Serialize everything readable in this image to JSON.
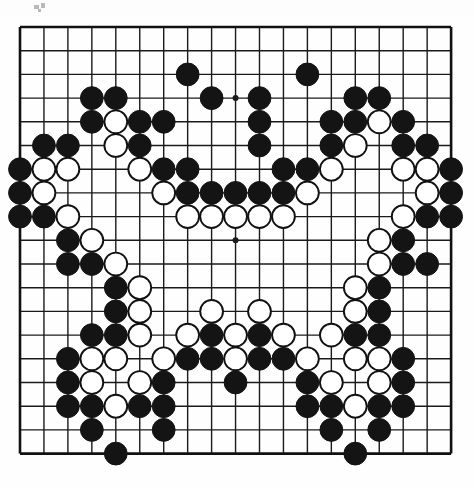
{
  "app": {
    "title": "Go board diagram",
    "type": "go-game-position",
    "board_size": 19
  },
  "board": {
    "background_color": "#fefefe",
    "line_color": "#1a1a1a",
    "border_color": "#111111",
    "black_stone_color": "#141414",
    "white_stone_color": "#ffffff",
    "white_stone_edge_color": "#111111",
    "origin_x": 20,
    "origin_y": 27,
    "spacing_x": 23.95,
    "spacing_y": 23.7,
    "line_width": 1.4,
    "border_width": 2.6,
    "stone_radius": 11.4,
    "star_point_radius": 3.0,
    "star_points": [
      {
        "col": 10,
        "row": 4
      },
      {
        "col": 10,
        "row": 10
      }
    ]
  },
  "chart_data": {
    "type": "table",
    "xlabel": "column 1-19 (left to right)",
    "ylabel": "row 1-19 (top to bottom)",
    "legend": [
      "B = black stone",
      "W = white stone"
    ],
    "black_count": 106,
    "white_count": 58,
    "stones": [
      {
        "col": 8,
        "row": 3,
        "color": "B"
      },
      {
        "col": 13,
        "row": 3,
        "color": "B"
      },
      {
        "col": 4,
        "row": 4,
        "color": "B"
      },
      {
        "col": 5,
        "row": 4,
        "color": "B"
      },
      {
        "col": 9,
        "row": 4,
        "color": "B"
      },
      {
        "col": 11,
        "row": 4,
        "color": "B"
      },
      {
        "col": 15,
        "row": 4,
        "color": "B"
      },
      {
        "col": 16,
        "row": 4,
        "color": "B"
      },
      {
        "col": 4,
        "row": 5,
        "color": "B"
      },
      {
        "col": 5,
        "row": 5,
        "color": "W"
      },
      {
        "col": 6,
        "row": 5,
        "color": "B"
      },
      {
        "col": 7,
        "row": 5,
        "color": "B"
      },
      {
        "col": 11,
        "row": 5,
        "color": "B"
      },
      {
        "col": 14,
        "row": 5,
        "color": "B"
      },
      {
        "col": 15,
        "row": 5,
        "color": "B"
      },
      {
        "col": 16,
        "row": 5,
        "color": "W"
      },
      {
        "col": 17,
        "row": 5,
        "color": "B"
      },
      {
        "col": 2,
        "row": 6,
        "color": "B"
      },
      {
        "col": 3,
        "row": 6,
        "color": "B"
      },
      {
        "col": 5,
        "row": 6,
        "color": "W"
      },
      {
        "col": 6,
        "row": 6,
        "color": "B"
      },
      {
        "col": 11,
        "row": 6,
        "color": "B"
      },
      {
        "col": 14,
        "row": 6,
        "color": "B"
      },
      {
        "col": 15,
        "row": 6,
        "color": "W"
      },
      {
        "col": 17,
        "row": 6,
        "color": "B"
      },
      {
        "col": 18,
        "row": 6,
        "color": "B"
      },
      {
        "col": 1,
        "row": 7,
        "color": "B"
      },
      {
        "col": 2,
        "row": 7,
        "color": "W"
      },
      {
        "col": 3,
        "row": 7,
        "color": "W"
      },
      {
        "col": 6,
        "row": 7,
        "color": "W"
      },
      {
        "col": 7,
        "row": 7,
        "color": "B"
      },
      {
        "col": 8,
        "row": 7,
        "color": "B"
      },
      {
        "col": 12,
        "row": 7,
        "color": "B"
      },
      {
        "col": 13,
        "row": 7,
        "color": "B"
      },
      {
        "col": 14,
        "row": 7,
        "color": "W"
      },
      {
        "col": 17,
        "row": 7,
        "color": "W"
      },
      {
        "col": 18,
        "row": 7,
        "color": "W"
      },
      {
        "col": 19,
        "row": 7,
        "color": "B"
      },
      {
        "col": 1,
        "row": 8,
        "color": "B"
      },
      {
        "col": 2,
        "row": 8,
        "color": "W"
      },
      {
        "col": 7,
        "row": 8,
        "color": "W"
      },
      {
        "col": 8,
        "row": 8,
        "color": "B"
      },
      {
        "col": 9,
        "row": 8,
        "color": "B"
      },
      {
        "col": 10,
        "row": 8,
        "color": "B"
      },
      {
        "col": 11,
        "row": 8,
        "color": "B"
      },
      {
        "col": 12,
        "row": 8,
        "color": "B"
      },
      {
        "col": 13,
        "row": 8,
        "color": "W"
      },
      {
        "col": 18,
        "row": 8,
        "color": "W"
      },
      {
        "col": 19,
        "row": 8,
        "color": "B"
      },
      {
        "col": 1,
        "row": 9,
        "color": "B"
      },
      {
        "col": 2,
        "row": 9,
        "color": "B"
      },
      {
        "col": 3,
        "row": 9,
        "color": "W"
      },
      {
        "col": 8,
        "row": 9,
        "color": "W"
      },
      {
        "col": 9,
        "row": 9,
        "color": "W"
      },
      {
        "col": 10,
        "row": 9,
        "color": "W"
      },
      {
        "col": 11,
        "row": 9,
        "color": "W"
      },
      {
        "col": 12,
        "row": 9,
        "color": "W"
      },
      {
        "col": 17,
        "row": 9,
        "color": "W"
      },
      {
        "col": 18,
        "row": 9,
        "color": "B"
      },
      {
        "col": 19,
        "row": 9,
        "color": "B"
      },
      {
        "col": 3,
        "row": 10,
        "color": "B"
      },
      {
        "col": 4,
        "row": 10,
        "color": "W"
      },
      {
        "col": 16,
        "row": 10,
        "color": "W"
      },
      {
        "col": 17,
        "row": 10,
        "color": "B"
      },
      {
        "col": 3,
        "row": 11,
        "color": "B"
      },
      {
        "col": 4,
        "row": 11,
        "color": "B"
      },
      {
        "col": 5,
        "row": 11,
        "color": "W"
      },
      {
        "col": 16,
        "row": 11,
        "color": "W"
      },
      {
        "col": 17,
        "row": 11,
        "color": "B"
      },
      {
        "col": 18,
        "row": 11,
        "color": "B"
      },
      {
        "col": 5,
        "row": 12,
        "color": "B"
      },
      {
        "col": 6,
        "row": 12,
        "color": "W"
      },
      {
        "col": 15,
        "row": 12,
        "color": "W"
      },
      {
        "col": 16,
        "row": 12,
        "color": "B"
      },
      {
        "col": 5,
        "row": 13,
        "color": "B"
      },
      {
        "col": 6,
        "row": 13,
        "color": "W"
      },
      {
        "col": 9,
        "row": 13,
        "color": "W"
      },
      {
        "col": 11,
        "row": 13,
        "color": "W"
      },
      {
        "col": 15,
        "row": 13,
        "color": "W"
      },
      {
        "col": 16,
        "row": 13,
        "color": "B"
      },
      {
        "col": 4,
        "row": 14,
        "color": "B"
      },
      {
        "col": 5,
        "row": 14,
        "color": "B"
      },
      {
        "col": 6,
        "row": 14,
        "color": "W"
      },
      {
        "col": 8,
        "row": 14,
        "color": "W"
      },
      {
        "col": 9,
        "row": 14,
        "color": "B"
      },
      {
        "col": 10,
        "row": 14,
        "color": "W"
      },
      {
        "col": 11,
        "row": 14,
        "color": "B"
      },
      {
        "col": 12,
        "row": 14,
        "color": "W"
      },
      {
        "col": 14,
        "row": 14,
        "color": "W"
      },
      {
        "col": 15,
        "row": 14,
        "color": "B"
      },
      {
        "col": 16,
        "row": 14,
        "color": "B"
      },
      {
        "col": 3,
        "row": 15,
        "color": "B"
      },
      {
        "col": 4,
        "row": 15,
        "color": "W"
      },
      {
        "col": 5,
        "row": 15,
        "color": "W"
      },
      {
        "col": 7,
        "row": 15,
        "color": "W"
      },
      {
        "col": 8,
        "row": 15,
        "color": "B"
      },
      {
        "col": 9,
        "row": 15,
        "color": "B"
      },
      {
        "col": 10,
        "row": 15,
        "color": "W"
      },
      {
        "col": 11,
        "row": 15,
        "color": "B"
      },
      {
        "col": 12,
        "row": 15,
        "color": "B"
      },
      {
        "col": 13,
        "row": 15,
        "color": "W"
      },
      {
        "col": 15,
        "row": 15,
        "color": "W"
      },
      {
        "col": 16,
        "row": 15,
        "color": "W"
      },
      {
        "col": 17,
        "row": 15,
        "color": "B"
      },
      {
        "col": 3,
        "row": 16,
        "color": "B"
      },
      {
        "col": 4,
        "row": 16,
        "color": "W"
      },
      {
        "col": 6,
        "row": 16,
        "color": "W"
      },
      {
        "col": 7,
        "row": 16,
        "color": "B"
      },
      {
        "col": 10,
        "row": 16,
        "color": "B"
      },
      {
        "col": 13,
        "row": 16,
        "color": "B"
      },
      {
        "col": 14,
        "row": 16,
        "color": "W"
      },
      {
        "col": 16,
        "row": 16,
        "color": "W"
      },
      {
        "col": 17,
        "row": 16,
        "color": "B"
      },
      {
        "col": 3,
        "row": 17,
        "color": "B"
      },
      {
        "col": 4,
        "row": 17,
        "color": "B"
      },
      {
        "col": 5,
        "row": 17,
        "color": "W"
      },
      {
        "col": 6,
        "row": 17,
        "color": "B"
      },
      {
        "col": 7,
        "row": 17,
        "color": "B"
      },
      {
        "col": 13,
        "row": 17,
        "color": "B"
      },
      {
        "col": 14,
        "row": 17,
        "color": "B"
      },
      {
        "col": 15,
        "row": 17,
        "color": "W"
      },
      {
        "col": 16,
        "row": 17,
        "color": "B"
      },
      {
        "col": 17,
        "row": 17,
        "color": "B"
      },
      {
        "col": 4,
        "row": 18,
        "color": "B"
      },
      {
        "col": 7,
        "row": 18,
        "color": "B"
      },
      {
        "col": 14,
        "row": 18,
        "color": "B"
      },
      {
        "col": 16,
        "row": 18,
        "color": "B"
      },
      {
        "col": 5,
        "row": 19,
        "color": "B"
      },
      {
        "col": 15,
        "row": 19,
        "color": "B"
      }
    ]
  },
  "artifacts": {
    "specks": [
      {
        "x": 34,
        "y": 5,
        "w": 5,
        "h": 4
      },
      {
        "x": 41,
        "y": 3,
        "w": 4,
        "h": 5
      },
      {
        "x": 38,
        "y": 9,
        "w": 3,
        "h": 3
      }
    ]
  }
}
